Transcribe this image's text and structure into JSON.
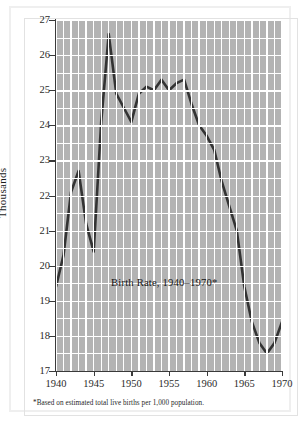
{
  "figure": {
    "caption_overlay": "Birth Rate, 1940–1970*",
    "footnote": "*Based on estimated total live births per 1,000 population.",
    "credit": "© Cengage Learning"
  },
  "chart_data": {
    "type": "line",
    "title": "Birth Rate, 1940–1970*",
    "xlabel": "",
    "ylabel": "Thousands",
    "xlim": [
      1940,
      1970
    ],
    "ylim": [
      17,
      27
    ],
    "grid": true,
    "legend": "none",
    "line_color": "#333333",
    "plot_background": "#b3b3b3",
    "gridline_color": "#ffffff",
    "xticks": [
      1940,
      1945,
      1950,
      1955,
      1960,
      1965,
      1970
    ],
    "xtick_labels": [
      "1940",
      "1945",
      "1950",
      "1955",
      "1960",
      "1965",
      "1970"
    ],
    "yticks": [
      17,
      18,
      19,
      20,
      21,
      22,
      23,
      24,
      25,
      26,
      27
    ],
    "ytick_labels": [
      "17",
      "18",
      "19",
      "20",
      "21",
      "22",
      "23",
      "24",
      "25",
      "26",
      "27"
    ],
    "x": [
      1940,
      1941,
      1942,
      1943,
      1944,
      1945,
      1946,
      1947,
      1948,
      1949,
      1950,
      1951,
      1952,
      1953,
      1954,
      1955,
      1956,
      1957,
      1958,
      1959,
      1960,
      1961,
      1962,
      1963,
      1964,
      1965,
      1966,
      1967,
      1968,
      1969,
      1970
    ],
    "values": [
      19.4,
      20.3,
      22.1,
      22.7,
      21.2,
      20.4,
      24.1,
      26.6,
      24.9,
      24.5,
      24.1,
      24.9,
      25.1,
      25.0,
      25.3,
      25.0,
      25.2,
      25.3,
      24.6,
      24.0,
      23.7,
      23.3,
      22.4,
      21.7,
      21.0,
      19.4,
      18.4,
      17.8,
      17.5,
      17.8,
      18.4
    ],
    "annotations": [
      {
        "text": "Birth Rate, 1940–1970*",
        "x": 1952,
        "y": 19.8
      },
      {
        "text": "*Based on estimated total live births per 1,000 population.",
        "position": "below-axis"
      }
    ]
  }
}
